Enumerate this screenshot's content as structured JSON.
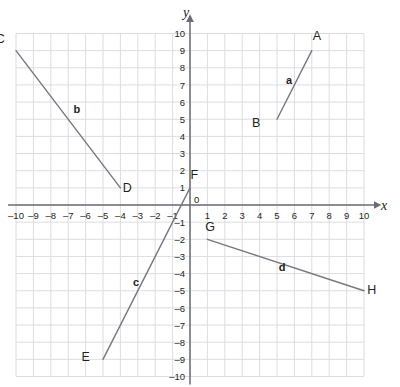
{
  "chart_data": {
    "type": "scatter",
    "title": "",
    "xlabel": "x",
    "ylabel": "y",
    "xlim": [
      -10,
      10
    ],
    "ylim": [
      -10,
      10
    ],
    "grid": true,
    "legend_position": "none",
    "x_tick_labels": [
      "-10",
      "-9",
      "-8",
      "-7",
      "-6",
      "-5",
      "-4",
      "-3",
      "-2",
      "-1",
      "1",
      "2",
      "3",
      "4",
      "5",
      "6",
      "7",
      "8",
      "9",
      "10"
    ],
    "y_tick_labels": [
      "10",
      "9",
      "8",
      "7",
      "6",
      "5",
      "4",
      "3",
      "2",
      "1",
      "-1",
      "-2",
      "-3",
      "-4",
      "-5",
      "-6",
      "-7",
      "-8",
      "-9",
      "-10"
    ],
    "origin_label": "0",
    "series": [
      {
        "name": "a",
        "label": "a",
        "label_at": [
          5.7,
          7.3
        ],
        "points": [
          {
            "name": "A",
            "x": 7,
            "y": 9,
            "label_dx": 0.3,
            "label_dy": 0.9
          },
          {
            "name": "B",
            "x": 5,
            "y": 5,
            "label_dx": -1.2,
            "label_dy": -0.2
          }
        ]
      },
      {
        "name": "b",
        "label": "b",
        "label_at": [
          -6.5,
          5.6
        ],
        "points": [
          {
            "name": "C",
            "x": -10,
            "y": 9,
            "label_dx": -0.9,
            "label_dy": 0.7
          },
          {
            "name": "D",
            "x": -4,
            "y": 1,
            "label_dx": 0.4,
            "label_dy": 0.0
          }
        ]
      },
      {
        "name": "c",
        "label": "c",
        "label_at": [
          -3.1,
          -4.5
        ],
        "points": [
          {
            "name": "E",
            "x": -5,
            "y": -9,
            "label_dx": -1.0,
            "label_dy": 0.15
          },
          {
            "name": "F",
            "x": 0,
            "y": 1,
            "label_dx": 0.25,
            "label_dy": 0.75
          }
        ]
      },
      {
        "name": "d",
        "label": "d",
        "label_at": [
          5.3,
          -3.6
        ],
        "points": [
          {
            "name": "G",
            "x": 1,
            "y": -2,
            "label_dx": 0.15,
            "label_dy": 0.75
          },
          {
            "name": "H",
            "x": 10,
            "y": -5,
            "label_dx": 0.45,
            "label_dy": 0.1
          }
        ]
      }
    ]
  },
  "colors": {
    "grid": "#dcdce4",
    "axis": "#6b6b73",
    "segment": "#77777f",
    "text": "#231f20",
    "background": "#ffffff"
  },
  "axes": {
    "x_name": "x",
    "y_name": "y"
  }
}
